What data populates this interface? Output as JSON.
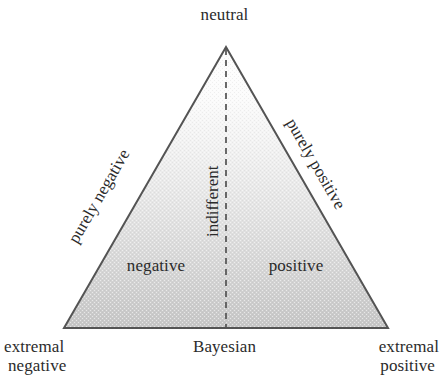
{
  "figure": {
    "width": 443,
    "height": 390,
    "background": "#ffffff",
    "stroke_color": "#555555",
    "fill_top_color": "#ffffff",
    "fill_bottom_color": "#c6c6c6",
    "text_color": "#2b2b2b",
    "divider_style": "dashed"
  },
  "geometry": {
    "apex": {
      "x": 226,
      "y": 47
    },
    "bottom_left": {
      "x": 64,
      "y": 328
    },
    "bottom_right": {
      "x": 388,
      "y": 328
    },
    "divider_x": 226
  },
  "labels": {
    "apex": "neutral",
    "left_edge": "purely negative",
    "right_edge": "purely positive",
    "center_axis": "indifferent",
    "left_region": "negative",
    "right_region": "positive",
    "base_center": "Bayesian",
    "bottom_left_line1": "extremal",
    "bottom_left_line2": "negative",
    "bottom_right_line1": "extremal",
    "bottom_right_line2": "positive"
  }
}
